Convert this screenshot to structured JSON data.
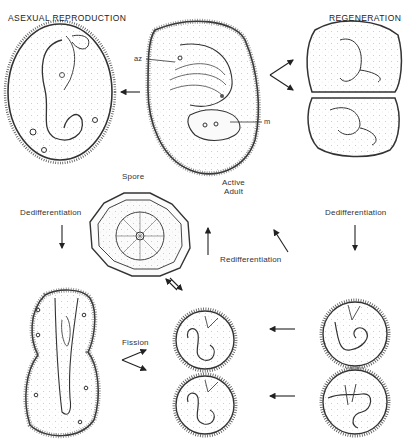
{
  "headings": {
    "left": "ASEXUAL REPRODUCTION",
    "right": "REGENERATION"
  },
  "labels": {
    "az": "az",
    "m": "m",
    "spore": "Spore",
    "active_adult_line1": "Active",
    "active_adult_line2": "Adult",
    "dedifferentiation_left": "Dedifferentiation",
    "dedifferentiation_right": "Dedifferentiation",
    "redifferentiation": "Redifferentiation",
    "fission": "Fission"
  },
  "colors": {
    "ink": "#2a2a2a",
    "background": "#ffffff",
    "cell_fill": "#f5f5f5"
  },
  "stages": [
    {
      "id": "asexual-adult",
      "position": "top-left"
    },
    {
      "id": "active-adult",
      "position": "top-center"
    },
    {
      "id": "regenerating-halves",
      "position": "top-right"
    },
    {
      "id": "spore",
      "position": "middle-center"
    },
    {
      "id": "dividing-cell",
      "position": "bottom-left"
    },
    {
      "id": "redifferentiating-cyst-upper",
      "position": "bottom-center-upper"
    },
    {
      "id": "redifferentiating-cyst-lower",
      "position": "bottom-center-lower"
    },
    {
      "id": "dedifferentiating-cyst-upper",
      "position": "bottom-right-upper"
    },
    {
      "id": "dedifferentiating-cyst-lower",
      "position": "bottom-right-lower"
    }
  ]
}
